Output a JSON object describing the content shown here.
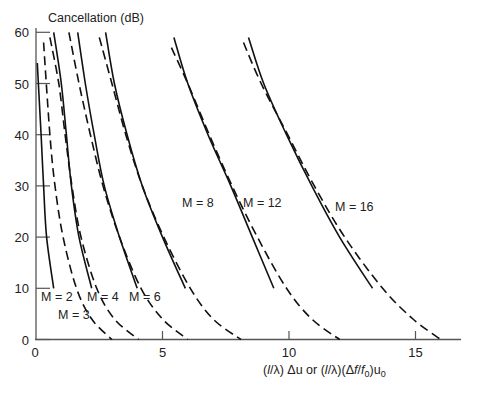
{
  "chart_data": {
    "type": "line",
    "title": "",
    "ylabel": "Cancellation (dB)",
    "xlabel": "(l/λ)Δu or (l/λ)(Δf/f0)u0",
    "xlabel_parts": {
      "a": "(",
      "l1": "l",
      "b": "/λ) Δu or (",
      "l2": "l",
      "c": "/λ)(Δ",
      "f": "f",
      "d": "/",
      "f0": "f",
      "sub0": "0",
      "e": ")u",
      "sub1": "0"
    },
    "xlim": [
      0,
      16.5
    ],
    "ylim": [
      0,
      60
    ],
    "xticks": [
      0,
      5,
      10,
      15
    ],
    "yticks": [
      0,
      10,
      20,
      30,
      40,
      50,
      60
    ],
    "grid": false,
    "legend": "inline labels",
    "colors": {
      "line": "#111111",
      "axis": "#555555",
      "text": "#222222"
    },
    "series": [
      {
        "name": "M = 2",
        "style": "solid",
        "label_pos": [
          41,
          297
        ],
        "points": [
          [
            0.05,
            54
          ],
          [
            0.2,
            40
          ],
          [
            0.3,
            30
          ],
          [
            0.42,
            20
          ],
          [
            0.7,
            10
          ]
        ]
      },
      {
        "name": "M = 3",
        "style": "dashed",
        "label_pos": [
          58,
          315
        ],
        "points": [
          [
            0.3,
            58
          ],
          [
            0.55,
            40
          ],
          [
            0.75,
            30
          ],
          [
            1.07,
            20
          ],
          [
            1.6,
            10
          ],
          [
            2.2,
            4
          ],
          [
            3.0,
            0
          ]
        ]
      },
      {
        "name": "M = 4",
        "style": "solid",
        "label_pos": [
          87,
          297
        ],
        "points": [
          [
            0.7,
            60
          ],
          [
            1.0,
            50
          ],
          [
            1.2,
            40
          ],
          [
            1.4,
            30
          ],
          [
            1.7,
            20
          ],
          [
            2.2,
            10
          ]
        ]
      },
      {
        "name": "M = 4 (dashed)",
        "style": "dashed",
        "points": [
          [
            0.55,
            59
          ],
          [
            0.9,
            50
          ],
          [
            1.15,
            40
          ],
          [
            1.42,
            30
          ],
          [
            1.78,
            20
          ],
          [
            2.4,
            10
          ],
          [
            3.1,
            4
          ],
          [
            4.05,
            0
          ]
        ]
      },
      {
        "name": "M = 6",
        "style": "solid",
        "label_pos": [
          129,
          297
        ],
        "points": [
          [
            1.65,
            60
          ],
          [
            1.95,
            50
          ],
          [
            2.3,
            40
          ],
          [
            2.7,
            30
          ],
          [
            3.3,
            20
          ],
          [
            4.0,
            10
          ]
        ]
      },
      {
        "name": "M = 6 (dashed)",
        "style": "dashed",
        "points": [
          [
            1.3,
            60
          ],
          [
            1.7,
            50
          ],
          [
            2.15,
            40
          ],
          [
            2.65,
            30
          ],
          [
            3.3,
            20
          ],
          [
            4.15,
            10
          ],
          [
            5.0,
            4
          ],
          [
            6.0,
            0
          ]
        ]
      },
      {
        "name": "M = 8",
        "style": "solid",
        "label_pos": [
          182,
          203
        ],
        "points": [
          [
            2.75,
            60
          ],
          [
            3.1,
            50
          ],
          [
            3.6,
            40
          ],
          [
            4.2,
            30
          ],
          [
            5.0,
            20
          ],
          [
            5.9,
            10
          ]
        ]
      },
      {
        "name": "M = 8 (dashed)",
        "style": "dashed",
        "points": [
          [
            2.5,
            59
          ],
          [
            3.0,
            50
          ],
          [
            3.55,
            40
          ],
          [
            4.2,
            30
          ],
          [
            5.05,
            20
          ],
          [
            6.1,
            10
          ],
          [
            7.0,
            4
          ],
          [
            8.1,
            0
          ]
        ]
      },
      {
        "name": "M = 12",
        "style": "solid",
        "label_pos": [
          243,
          203
        ],
        "points": [
          [
            5.45,
            59
          ],
          [
            6.0,
            50
          ],
          [
            6.8,
            40
          ],
          [
            7.7,
            30
          ],
          [
            8.55,
            20
          ],
          [
            9.4,
            10
          ]
        ]
      },
      {
        "name": "M = 12 (dashed)",
        "style": "dashed",
        "points": [
          [
            5.35,
            57
          ],
          [
            6.0,
            50
          ],
          [
            6.85,
            40
          ],
          [
            7.75,
            30
          ],
          [
            8.75,
            20
          ],
          [
            9.9,
            10
          ],
          [
            10.9,
            4
          ],
          [
            12.0,
            0
          ]
        ]
      },
      {
        "name": "M = 16",
        "style": "solid",
        "label_pos": [
          335,
          207
        ],
        "points": [
          [
            8.4,
            59
          ],
          [
            9.0,
            50
          ],
          [
            9.9,
            40
          ],
          [
            10.9,
            30
          ],
          [
            12.0,
            20
          ],
          [
            13.3,
            10
          ]
        ]
      },
      {
        "name": "M = 16 (dashed)",
        "style": "dashed",
        "points": [
          [
            8.2,
            58
          ],
          [
            8.9,
            50
          ],
          [
            9.95,
            40
          ],
          [
            11.0,
            30
          ],
          [
            12.2,
            20
          ],
          [
            13.7,
            10
          ],
          [
            14.9,
            4
          ],
          [
            16.0,
            0
          ]
        ]
      }
    ],
    "labels": [
      "M = 2",
      "M = 3",
      "M = 4",
      "M = 6",
      "M = 8",
      "M = 12",
      "M = 16"
    ]
  }
}
